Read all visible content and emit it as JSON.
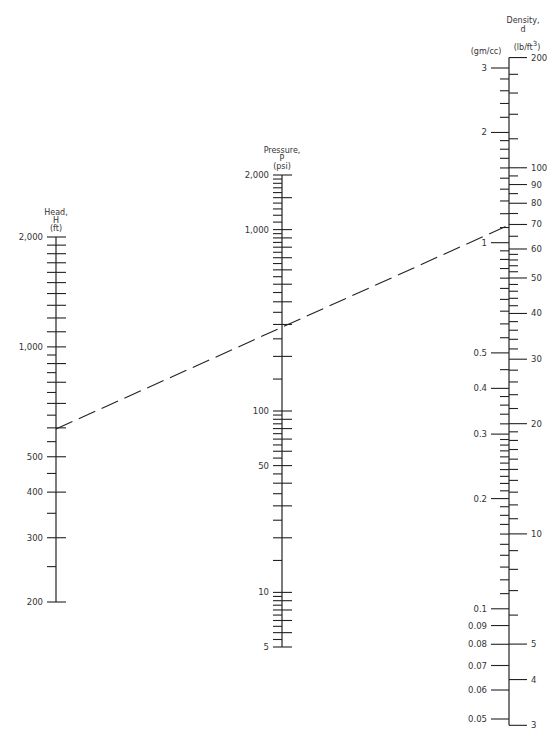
{
  "chart_data": {
    "type": "nomograph",
    "title": "",
    "colors": {
      "ink": "#222222",
      "text": "#333333",
      "background": "#ffffff"
    },
    "axes": [
      {
        "id": "head",
        "title_lines": [
          "Head,",
          "H",
          "(ft)"
        ],
        "x": 56,
        "scale": "log",
        "range": [
          200,
          2000
        ],
        "y_at_min": 602,
        "y_at_max": 237,
        "labels": [
          2000,
          1000,
          500,
          400,
          300,
          200
        ],
        "label_text": [
          "2,000",
          "1,000",
          "500",
          "400",
          "300",
          "200"
        ],
        "ticks": [
          2000,
          1900,
          1800,
          1700,
          1600,
          1500,
          1400,
          1300,
          1200,
          1100,
          1000,
          950,
          900,
          850,
          800,
          750,
          700,
          650,
          600,
          550,
          500,
          450,
          400,
          350,
          300,
          250,
          200
        ],
        "major_ticks": [
          2000,
          1900,
          1800,
          1700,
          1600,
          1500,
          1400,
          1300,
          1200,
          1100,
          1000,
          900,
          800,
          700,
          600,
          500,
          400,
          300,
          200
        ],
        "label_side": "left"
      },
      {
        "id": "pressure",
        "title_lines": [
          "Pressure,",
          "P",
          "(psi)"
        ],
        "x": 282,
        "scale": "log",
        "range": [
          5,
          2000
        ],
        "y_at_min": 647,
        "y_at_max": 175,
        "labels": [
          2000,
          1000,
          100,
          50,
          10,
          5
        ],
        "label_text": [
          "2,000",
          "1,000",
          "100",
          "50",
          "10",
          "5"
        ],
        "ticks": [
          2000,
          1900,
          1800,
          1700,
          1600,
          1500,
          1400,
          1300,
          1200,
          1100,
          1000,
          950,
          900,
          850,
          800,
          750,
          700,
          650,
          600,
          550,
          500,
          450,
          400,
          350,
          300,
          250,
          200,
          150,
          100,
          95,
          90,
          85,
          80,
          75,
          70,
          65,
          60,
          55,
          50,
          45,
          40,
          35,
          30,
          25,
          20,
          15,
          10,
          9.5,
          9,
          8.5,
          8,
          7.5,
          7,
          6.5,
          6,
          5.5,
          5
        ],
        "major_ticks": [
          2000,
          1500,
          1000,
          900,
          800,
          700,
          600,
          500,
          400,
          300,
          200,
          100,
          90,
          80,
          70,
          60,
          50,
          40,
          30,
          20,
          10,
          9,
          8,
          7,
          6,
          5
        ],
        "label_side": "left"
      },
      {
        "id": "density",
        "title_lines": [
          "Density,",
          "d"
        ],
        "x": 509,
        "scale": "log",
        "left_units": "(gm/cc)",
        "right_units": "(lb/ft",
        "right_units_sup": "3",
        "right_units_close": ")",
        "left_range": [
          0.05,
          3
        ],
        "y_at_left_min": 719,
        "y_at_left_max": 68,
        "left_labels": [
          3,
          2,
          1,
          0.5,
          0.4,
          0.3,
          0.2,
          0.1,
          0.09,
          0.08,
          0.07,
          0.06,
          0.05
        ],
        "left_label_text": [
          "3",
          "2",
          "1",
          "0.5",
          "0.4",
          "0.3",
          "0.2",
          "0.1",
          "0.09",
          "0.08",
          "0.07",
          "0.06",
          "0.05"
        ],
        "left_ticks": [
          3,
          2.8,
          2.6,
          2.4,
          2.2,
          2,
          1.9,
          1.8,
          1.7,
          1.6,
          1.5,
          1.4,
          1.3,
          1.2,
          1.1,
          1,
          0.95,
          0.9,
          0.85,
          0.8,
          0.75,
          0.7,
          0.65,
          0.6,
          0.55,
          0.5,
          0.45,
          0.4,
          0.38,
          0.36,
          0.34,
          0.32,
          0.3,
          0.29,
          0.28,
          0.27,
          0.26,
          0.25,
          0.24,
          0.23,
          0.22,
          0.21,
          0.2,
          0.19,
          0.18,
          0.17,
          0.16,
          0.15,
          0.14,
          0.13,
          0.12,
          0.11,
          0.1,
          0.09,
          0.08,
          0.07,
          0.06,
          0.05
        ],
        "right_range": [
          3,
          200
        ],
        "right_labels": [
          200,
          100,
          90,
          80,
          70,
          60,
          50,
          40,
          30,
          20,
          10,
          5,
          4,
          3
        ],
        "right_label_text": [
          "200",
          "100",
          "90",
          "80",
          "70",
          "60",
          "50",
          "40",
          "30",
          "20",
          "10",
          "5",
          "4",
          "3"
        ],
        "right_ticks": [
          200,
          180,
          160,
          140,
          120,
          100,
          95,
          90,
          85,
          80,
          75,
          70,
          65,
          60,
          58,
          56,
          54,
          52,
          50,
          48,
          46,
          44,
          42,
          40,
          38,
          36,
          34,
          32,
          30,
          28,
          26,
          24,
          22,
          20,
          19,
          18,
          17,
          16,
          15,
          14,
          13,
          12,
          11,
          10,
          9,
          8,
          7,
          6,
          5,
          4,
          3
        ],
        "lb_per_gmcc": 62.43
      }
    ],
    "isopleth": {
      "style": "dashed",
      "points": [
        {
          "axis": "head",
          "value": 590,
          "x": 56,
          "y": 429
        },
        {
          "axis": "pressure",
          "value": 255,
          "x": 282,
          "y": 325
        },
        {
          "axis": "density",
          "value_lb_ft3": 70,
          "value_gm_cc": 1.12,
          "x": 509,
          "y": 225
        }
      ]
    }
  }
}
